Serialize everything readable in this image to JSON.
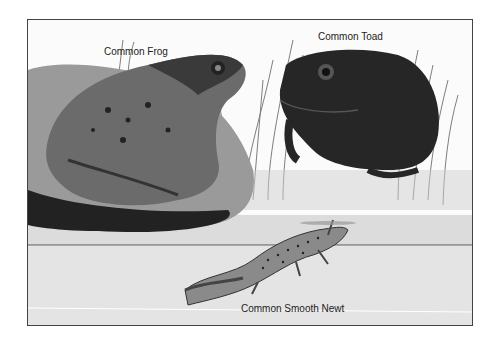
{
  "illustration": {
    "description": "Black and white watercolor illustration of three amphibians",
    "labels": {
      "frog": "Common Frog",
      "toad": "Common Toad",
      "newt": "Common Smooth Newt"
    }
  }
}
